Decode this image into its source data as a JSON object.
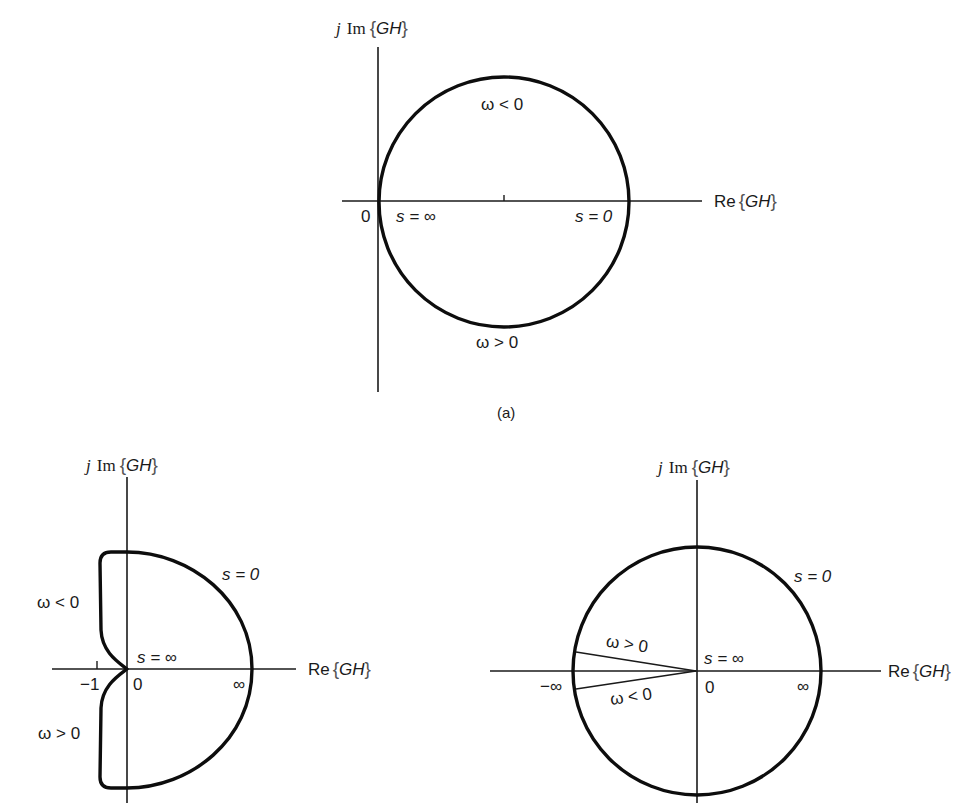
{
  "figure": {
    "caption_a": "(a)",
    "colors": {
      "ink": "#1a1a1a",
      "background": "#ffffff"
    },
    "panels": [
      {
        "id": "a",
        "axis_labels": {
          "imag_prefix": "j",
          "imag_func": "Im",
          "real_func": "Re",
          "arg": "GH",
          "brace_open": "{",
          "brace_close": "}"
        },
        "labels": {
          "origin": "0",
          "s_inf": "s = ∞",
          "s_zero": "s = 0",
          "omega_neg": "ω < 0",
          "omega_pos": "ω > 0"
        }
      },
      {
        "id": "b",
        "axis_labels": {
          "imag_prefix": "j",
          "imag_func": "Im",
          "real_func": "Re",
          "arg": "GH",
          "brace_open": "{",
          "brace_close": "}"
        },
        "labels": {
          "s_zero": "s = 0",
          "omega_neg": "ω < 0",
          "omega_pos": "ω > 0",
          "s_inf": "s = ∞",
          "minus_one": "−1",
          "origin": "0",
          "infinity": "∞"
        }
      },
      {
        "id": "c",
        "axis_labels": {
          "imag_prefix": "j",
          "imag_func": "Im",
          "real_func": "Re",
          "arg": "GH",
          "brace_open": "{",
          "brace_close": "}"
        },
        "labels": {
          "s_zero": "s = 0",
          "omega_pos": "ω > 0",
          "omega_neg": "ω < 0",
          "s_inf": "s = ∞",
          "minus_infinity": "−∞",
          "origin": "0",
          "infinity": "∞"
        }
      }
    ]
  }
}
